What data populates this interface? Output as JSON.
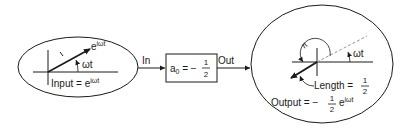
{
  "colors": {
    "ink": "#1a1a1a",
    "dashed": "#8a8a8a",
    "background": "#ffffff"
  },
  "input_panel": {
    "vector_label_base": "e",
    "vector_label_exp": "iωt",
    "angle_label": "ωt",
    "unit_tick_label": "1",
    "caption_prefix": "Input = e",
    "caption_exp": "iωt"
  },
  "connector_in": {
    "label": "In"
  },
  "system_block": {
    "lhs": "a",
    "lhs_sub": "0",
    "equals": " = −",
    "frac_num": "1",
    "frac_den": "2"
  },
  "connector_out": {
    "label": "Out"
  },
  "output_panel": {
    "phase_label": "π",
    "angle_label": "ωt",
    "length_label": "Length = ",
    "length_num": "1",
    "length_den": "2",
    "caption_prefix": "Output = −",
    "caption_num": "1",
    "caption_den": "2",
    "caption_base": "e",
    "caption_exp": "iωt"
  }
}
